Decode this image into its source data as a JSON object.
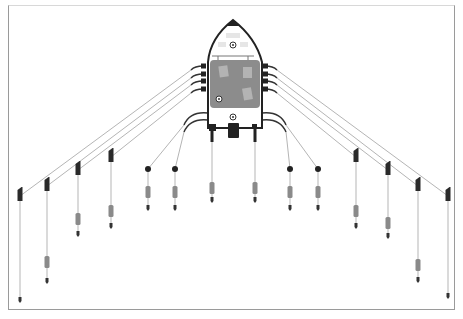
{
  "figure": {
    "caption": "",
    "colors": {
      "hull_outline": "#222222",
      "deck": "#8c8c8c",
      "deck_panel": "#b0b0b0",
      "line": "#b5b5b5",
      "rod_holder": "#2a2a2a",
      "weight": "#8a8a8a",
      "lure": "#333333",
      "frame": "#9a9a9a"
    }
  },
  "boat": {
    "bow": [
      233,
      20
    ],
    "hull_left": 208,
    "hull_right": 262,
    "deck_top": 60,
    "deck_bottom": 108,
    "stern_bottom": 128
  },
  "outrigger_lines": [
    {
      "side": "left",
      "from": [
        203,
        66
      ],
      "to": [
        20,
        196
      ],
      "lure_y": 300,
      "weight_y": null
    },
    {
      "side": "left",
      "from": [
        203,
        74
      ],
      "to": [
        47,
        186
      ],
      "lure_y": 281,
      "weight_y": 262
    },
    {
      "side": "left",
      "from": [
        203,
        81
      ],
      "to": [
        78,
        170
      ],
      "lure_y": 234,
      "weight_y": 219
    },
    {
      "side": "left",
      "from": [
        203,
        89
      ],
      "to": [
        111,
        157
      ],
      "lure_y": 226,
      "weight_y": 211
    },
    {
      "side": "right",
      "from": [
        265,
        66
      ],
      "to": [
        448,
        196
      ],
      "lure_y": 296,
      "weight_y": null
    },
    {
      "side": "right",
      "from": [
        265,
        74
      ],
      "to": [
        418,
        186
      ],
      "lure_y": 280,
      "weight_y": 265
    },
    {
      "side": "right",
      "from": [
        265,
        81
      ],
      "to": [
        388,
        170
      ],
      "lure_y": 236,
      "weight_y": 223
    },
    {
      "side": "right",
      "from": [
        265,
        89
      ],
      "to": [
        356,
        157
      ],
      "lure_y": 226,
      "weight_y": 211
    }
  ],
  "inner_lines": [
    {
      "from": [
        208,
        113
      ],
      "to": [
        148,
        169
      ],
      "lure_y": 208,
      "weight_y": 192
    },
    {
      "from": [
        208,
        120
      ],
      "to": [
        175,
        169
      ],
      "lure_y": 208,
      "weight_y": 192
    },
    {
      "from": [
        262,
        113
      ],
      "to": [
        318,
        169
      ],
      "lure_y": 208,
      "weight_y": 192
    },
    {
      "from": [
        262,
        120
      ],
      "to": [
        290,
        169
      ],
      "lure_y": 208,
      "weight_y": 192
    }
  ],
  "downriggers": [
    {
      "x": 212,
      "top": 128,
      "weight_y": 188,
      "lure_y": 200
    },
    {
      "x": 255,
      "top": 128,
      "weight_y": 188,
      "lure_y": 200
    }
  ]
}
